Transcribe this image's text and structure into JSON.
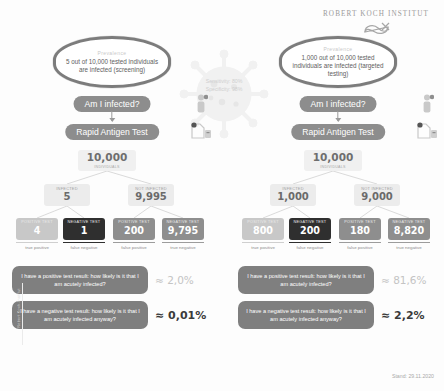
{
  "header": {
    "institute": "ROBERT KOCH INSTITUT",
    "logo_icon": "rki-swoosh-logo"
  },
  "center": {
    "virus_icon": "coronavirus-icon",
    "sensitivity": "Sensitivity: 80%",
    "specificity": "Specificity: 98%"
  },
  "footer": {
    "stamp": "Stand: 29.11.2020",
    "sidemark": "Robert Koch-Institut"
  },
  "scenarios": [
    {
      "id": "screening",
      "prevalence_title": "Prevalence",
      "prevalence_text": "5 out of 10,000 tested individuals are infected (screening)",
      "question_pill": "Am I infected?",
      "test_pill": "Rapid Antigen Test",
      "person_icon": "person-infected-icon",
      "kit_icon": "test-kit-icon",
      "tree": {
        "root": {
          "caption": "INDIVIDUALS",
          "value": "10,000"
        },
        "infected": {
          "caption": "INFECTED",
          "value": "5"
        },
        "not_infected": {
          "caption": "NOT INFECTED",
          "value": "9,995"
        },
        "leaves": [
          {
            "caption": "POSITIVE TEST",
            "value": "4",
            "label": "true positive"
          },
          {
            "caption": "NEGATIVE TEST",
            "value": "1",
            "label": "false negative"
          },
          {
            "caption": "POSITIVE TEST",
            "value": "200",
            "label": "false positive"
          },
          {
            "caption": "NEGATIVE TEST",
            "value": "9,795",
            "label": "true negative"
          }
        ]
      },
      "questions": [
        {
          "text": "I have a positive test result: how likely is it that I am acutely infected?",
          "result": "≈ 2,0%",
          "emphasis": "light"
        },
        {
          "text": "I have a negative test result: how likely is it that I am acutely infected anyway?",
          "result": "≈ 0,01%",
          "emphasis": "dark"
        }
      ]
    },
    {
      "id": "targeted",
      "prevalence_title": "Prevalence",
      "prevalence_text": "1,000 out of 10,000 tested individuals are infected (targeted testing)",
      "question_pill": "Am I infected?",
      "test_pill": "Rapid Antigen Test",
      "person_icon": "person-infected-icon",
      "kit_icon": "test-kit-icon",
      "tree": {
        "root": {
          "caption": "INDIVIDUALS",
          "value": "10,000"
        },
        "infected": {
          "caption": "INFECTED",
          "value": "1,000"
        },
        "not_infected": {
          "caption": "NOT INFECTED",
          "value": "9,000"
        },
        "leaves": [
          {
            "caption": "POSITIVE TEST",
            "value": "800",
            "label": "true positive"
          },
          {
            "caption": "NEGATIVE TEST",
            "value": "200",
            "label": "false negative"
          },
          {
            "caption": "POSITIVE TEST",
            "value": "180",
            "label": "false positive"
          },
          {
            "caption": "NEGATIVE TEST",
            "value": "8,820",
            "label": "true negative"
          }
        ]
      },
      "questions": [
        {
          "text": "I have a positive test result: how likely is it that I am acutely infected?",
          "result": "≈ 81,6%",
          "emphasis": "light"
        },
        {
          "text": "I have a negative test result: how likely is it that I am acutely infected anyway?",
          "result": "≈ 2,2%",
          "emphasis": "dark"
        }
      ]
    }
  ]
}
